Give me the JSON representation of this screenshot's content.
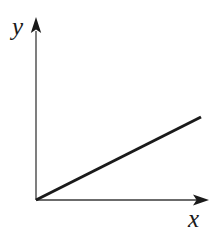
{
  "figure": {
    "background_color": "#ffffff",
    "width": 218,
    "height": 236,
    "y_axis_label": "y",
    "x_axis_label": "x"
  },
  "chart_data": {
    "type": "line",
    "title": "",
    "subtitle": "",
    "xlabel": "x",
    "ylabel": "y",
    "grid": false,
    "legend": null,
    "legend_position": "none",
    "axis_style": {
      "color": "#3a3a3a",
      "line_width": 1.3,
      "arrowheads": true,
      "arrowhead_color": "#1a1a1a",
      "ticks": false,
      "tick_labels": false,
      "origin_pixel": [
        36,
        200
      ]
    },
    "xlim": [
      0,
      1
    ],
    "ylim": [
      0,
      1
    ],
    "annotations": [],
    "series": [
      {
        "name": "proportional line",
        "color": "#1a1a1a",
        "line_width": 3,
        "style": "solid",
        "description": "straight ray from the origin with positive constant slope",
        "x": [
          0,
          1
        ],
        "y": [
          0,
          0.5
        ],
        "pixel_start": [
          36,
          200
        ],
        "pixel_end": [
          201,
          117
        ],
        "slope": 0.5
      }
    ]
  }
}
